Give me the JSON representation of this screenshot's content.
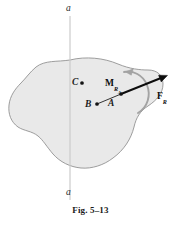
{
  "figure": {
    "caption": "Fig. 5–13",
    "axis": {
      "label_top": "a",
      "label_bottom": "a",
      "color": "#c9c9c9",
      "x_position": 70,
      "y_start": 16,
      "y_end": 200
    },
    "body": {
      "name": "rigid-body-blob",
      "fill_color": "#e9e9e9",
      "stroke_color": "#8d8d8d"
    },
    "points": [
      {
        "id": "C",
        "label": "C",
        "x": 82,
        "y": 83,
        "dot": true
      },
      {
        "id": "B",
        "label": "B",
        "x": 97,
        "y": 104,
        "dot": true
      },
      {
        "id": "A",
        "label": "A",
        "x": 121,
        "y": 94,
        "dot": true
      }
    ],
    "connector": {
      "name": "line-b-to-a",
      "from": "B",
      "to": "A",
      "color": "#2a2a2a"
    },
    "force_vector": {
      "label_html": "F<sub>R</sub>",
      "label_main": "F",
      "label_sub": "R",
      "color": "#0d0d0d",
      "tail_x": 121,
      "tail_y": 94,
      "tip_x": 166,
      "tip_y": 76
    },
    "moment_vector": {
      "label_main": "M",
      "label_sub": "R",
      "label_subsub": "A",
      "color": "#9a9a9a",
      "sense": "counterclockwise",
      "center_x": 126,
      "center_y": 95,
      "radius": 22
    }
  }
}
